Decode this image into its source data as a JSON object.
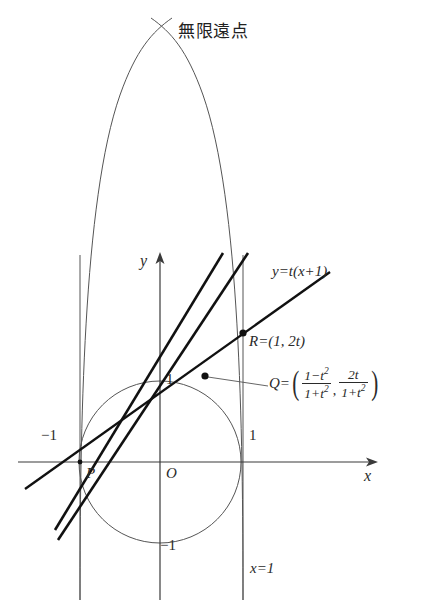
{
  "figure": {
    "title_annotation": "無限遠点",
    "axes": {
      "x_axis_label": "x",
      "y_axis_label": "y",
      "origin_label": "O"
    },
    "ticks": {
      "x_neg_one": "−1",
      "x_pos_one": "1",
      "y_pos_one": "1",
      "y_neg_one": "−1"
    },
    "points": {
      "p_label": "P",
      "r_label": "R=(1, 2t)",
      "q_prefix": "Q=",
      "q_x_numerator": "1−t",
      "q_x_num_exp": "2",
      "q_x_denominator": "1+t",
      "q_x_den_exp": "2",
      "q_y_numerator": "2t",
      "q_y_denominator": "1+t",
      "q_y_den_exp": "2",
      "paren_open": "(",
      "paren_close": ")",
      "comma": ","
    },
    "lines": {
      "family_label": "y=t(x+1)",
      "vertical_line_label": "x=1"
    },
    "colors": {
      "ink": "#2a2a2a",
      "thin_curve": "#555555",
      "bold_line": "#111111",
      "axis": "#3a3a3a"
    }
  }
}
